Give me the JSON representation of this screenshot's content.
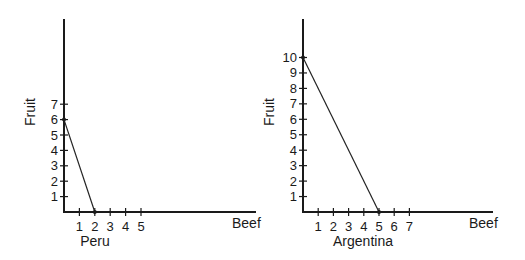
{
  "chart_data": [
    {
      "type": "line",
      "title": "Peru",
      "xlabel": "Beef",
      "ylabel": "Fruit",
      "x_ticks": [
        1,
        2,
        3,
        4,
        5
      ],
      "y_ticks": [
        1,
        2,
        3,
        4,
        5,
        6,
        7
      ],
      "grid": false,
      "series": [
        {
          "name": "Peru PPF",
          "points": [
            [
              0,
              6
            ],
            [
              2,
              0
            ]
          ]
        }
      ]
    },
    {
      "type": "line",
      "title": "Argentina",
      "xlabel": "Beef",
      "ylabel": "Fruit",
      "x_ticks": [
        1,
        2,
        3,
        4,
        5,
        6,
        7
      ],
      "y_ticks": [
        1,
        2,
        3,
        4,
        5,
        6,
        7,
        8,
        9,
        10
      ],
      "grid": false,
      "series": [
        {
          "name": "Argentina PPF",
          "points": [
            [
              0,
              10
            ],
            [
              5,
              0
            ]
          ]
        }
      ]
    }
  ],
  "charts": [
    {
      "id": "peru",
      "caption": "Peru",
      "xlabel": "Beef",
      "ylabel": "Fruit",
      "origin": [
        64,
        212
      ],
      "x_end": 256,
      "y_top": 19,
      "x_step": 15.4,
      "y_step": 15.4,
      "x_ticks": [
        "1",
        "2",
        "3",
        "4",
        "5"
      ],
      "y_ticks": [
        "1",
        "2",
        "3",
        "4",
        "5",
        "6",
        "7"
      ],
      "line": [
        [
          0,
          6
        ],
        [
          2,
          0
        ]
      ],
      "caption_pos": [
        95,
        246
      ],
      "xlabel_pos": [
        232,
        228
      ]
    },
    {
      "id": "argentina",
      "caption": "Argentina",
      "xlabel": "Beef",
      "ylabel": "Fruit",
      "origin": [
        303,
        212
      ],
      "x_end": 493,
      "y_top": 19,
      "x_step": 15.2,
      "y_step": 15.45,
      "x_ticks": [
        "1",
        "2",
        "3",
        "4",
        "5",
        "6",
        "7"
      ],
      "y_ticks": [
        "1",
        "2",
        "3",
        "4",
        "5",
        "6",
        "7",
        "8",
        "9",
        "10"
      ],
      "line": [
        [
          0,
          10
        ],
        [
          5,
          0
        ]
      ],
      "caption_pos": [
        363,
        246
      ],
      "xlabel_pos": [
        469,
        228
      ]
    }
  ]
}
